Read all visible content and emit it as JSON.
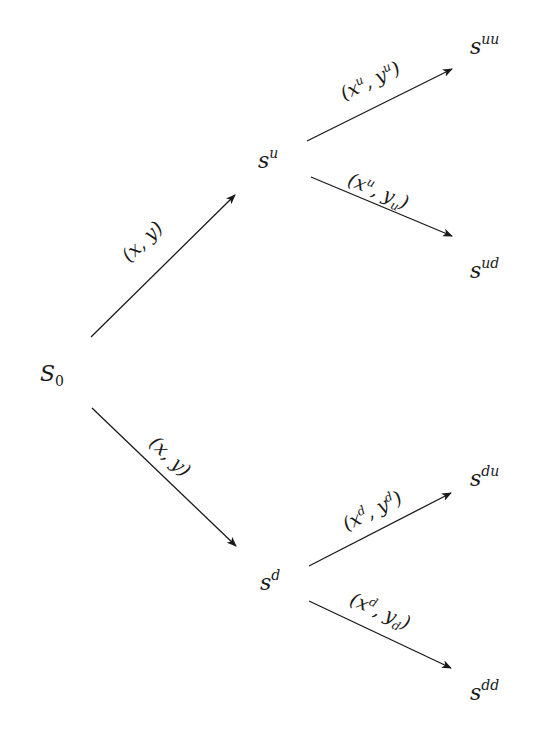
{
  "diagram": {
    "type": "binomial-tree",
    "colors": {
      "ink": "#1a1a1a",
      "background": "#ffffff"
    },
    "nodes": {
      "root": {
        "base": "S",
        "sub": "0",
        "sup": ""
      },
      "u": {
        "base": "s",
        "sup": "u",
        "sub": ""
      },
      "d": {
        "base": "s",
        "sup": "d",
        "sub": ""
      },
      "uu": {
        "base": "s",
        "sup": "uu",
        "sub": ""
      },
      "ud": {
        "base": "s",
        "sup": "ud",
        "sub": ""
      },
      "du": {
        "base": "s",
        "sup": "du",
        "sub": ""
      },
      "dd": {
        "base": "s",
        "sup": "dd",
        "sub": ""
      }
    },
    "edges": {
      "root_u": {
        "from": "root",
        "to": "u",
        "label": {
          "open": "(",
          "x": "x",
          "x_sup": "",
          "comma": ",",
          "y": "y",
          "y_sup": "",
          "y_sub": "",
          "close": ")"
        }
      },
      "root_d": {
        "from": "root",
        "to": "d",
        "label": {
          "open": "(",
          "x": "x",
          "x_sup": "",
          "comma": ",",
          "y": "y",
          "y_sup": "",
          "y_sub": "",
          "close": ")"
        }
      },
      "u_uu": {
        "from": "u",
        "to": "uu",
        "label": {
          "open": "(",
          "x": "x",
          "x_sup": "u",
          "comma": ",",
          "y": "y",
          "y_sup": "u",
          "y_sub": "",
          "close": ")"
        }
      },
      "u_ud": {
        "from": "u",
        "to": "ud",
        "label": {
          "open": "(",
          "x": "x",
          "x_sup": "u",
          "comma": ",",
          "y": "y",
          "y_sup": "",
          "y_sub": "u",
          "close": ")"
        }
      },
      "d_du": {
        "from": "d",
        "to": "du",
        "label": {
          "open": "(",
          "x": "x",
          "x_sup": "d",
          "comma": ",",
          "y": "y",
          "y_sup": "d",
          "y_sub": "",
          "close": ")"
        }
      },
      "d_dd": {
        "from": "d",
        "to": "dd",
        "label": {
          "open": "(",
          "x": "x",
          "x_sup": "d",
          "comma": ",",
          "y": "y",
          "y_sup": "",
          "y_sub": "d",
          "close": ")"
        }
      }
    }
  }
}
